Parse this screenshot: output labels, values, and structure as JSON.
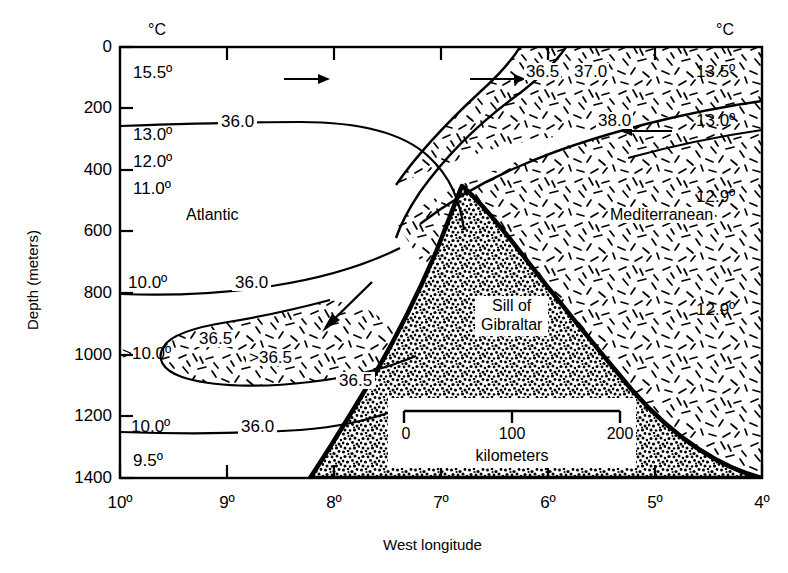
{
  "figure": {
    "type": "oceanographic-cross-section",
    "x_axis": {
      "title": "West longitude",
      "ticks": [
        "10º",
        "9º",
        "8º",
        "7º",
        "6º",
        "5º",
        "4º"
      ],
      "values": [
        10,
        9,
        8,
        7,
        6,
        5,
        4
      ],
      "direction": "decreasing-west"
    },
    "y_axis": {
      "title": "Depth (meters)",
      "ticks": [
        "0",
        "200",
        "400",
        "600",
        "800",
        "1000",
        "1200",
        "1400"
      ],
      "values": [
        0,
        200,
        400,
        600,
        800,
        1000,
        1200,
        1400
      ],
      "range": [
        0,
        1400
      ],
      "inverted": true
    },
    "column_headers": {
      "left": "°C",
      "right": "°C"
    },
    "regions": {
      "atlantic": "Atlantic",
      "mediterranean": "Mediterranean",
      "sill_line1": "Sill of",
      "sill_line2": "Gibraltar"
    },
    "temperatures_left": [
      {
        "label": "15.5º",
        "depth": 100
      },
      {
        "label": "13.0º",
        "depth": 260
      },
      {
        "label": "12.0º",
        "depth": 330
      },
      {
        "label": "11.0º",
        "depth": 400
      },
      {
        "label": "10.0º",
        "depth": 760
      },
      {
        "label": ">10.0º",
        "depth": 1000
      },
      {
        "label": "10.0º",
        "depth": 1255
      },
      {
        "label": "9.5º",
        "depth": 1360
      }
    ],
    "temperatures_right": [
      {
        "label": "13.5º",
        "depth": 85
      },
      {
        "label": "13.0º",
        "depth": 185
      },
      {
        "label": "12.9º",
        "depth": 400
      },
      {
        "label": "12.9º",
        "depth": 840
      }
    ],
    "salinity_contours": [
      {
        "label": "36.0",
        "position": "upper-atlantic"
      },
      {
        "label": "36.0",
        "position": "mid-atlantic-800m"
      },
      {
        "label": "36.5",
        "position": "tongue-upper-950m"
      },
      {
        "label": ">36.5",
        "position": "tongue-core-1000m"
      },
      {
        "label": "36.5",
        "position": "tongue-east-1090m"
      },
      {
        "label": "36.0",
        "position": "lower-atlantic-1255m"
      },
      {
        "label": "36.5",
        "position": "strait-upper-right"
      },
      {
        "label": "37.0",
        "position": "strait-upper-right"
      },
      {
        "label": "38.0",
        "position": "mediterranean-core"
      }
    ],
    "flow_arrows": [
      {
        "direction": "right",
        "meaning": "atlantic-inflow-surface"
      },
      {
        "direction": "right",
        "meaning": "atlantic-inflow-surface"
      },
      {
        "direction": "left",
        "meaning": "mediterranean-inflow-upper"
      },
      {
        "direction": "down-left",
        "meaning": "mediterranean-outflow-deep"
      }
    ],
    "scale_bar": {
      "ticks": [
        "0",
        "100",
        "200"
      ],
      "values": [
        0,
        100,
        200
      ],
      "unit": "kilometers"
    }
  }
}
